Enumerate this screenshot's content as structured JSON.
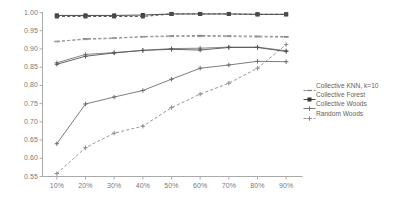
{
  "chart_data": {
    "type": "line",
    "title": "",
    "xlabel": "",
    "ylabel": "",
    "categories": [
      "10%",
      "20%",
      "30%",
      "40%",
      "50%",
      "60%",
      "70%",
      "80%",
      "90%"
    ],
    "x_tick_labels": [
      "10%",
      "20%",
      "30%",
      "40%",
      "50%",
      "60%",
      "70%",
      "80%",
      "90%"
    ],
    "y_tick_labels": [
      "1.00",
      "0.95",
      "0.90",
      "0.85",
      "0.80",
      "0.75",
      "0.70",
      "0.65",
      "0.60",
      "0.55"
    ],
    "y_ticks": [
      1.0,
      0.95,
      0.9,
      0.85,
      0.8,
      0.75,
      0.7,
      0.65,
      0.6,
      0.55
    ],
    "ylim": [
      0.55,
      1.0
    ],
    "grid": false,
    "legend_position": "right",
    "series": [
      {
        "name": "Collective KNN, k=10",
        "style": "dashed",
        "marker": "dash",
        "color": "#808080",
        "values": [
          0.92,
          0.928,
          0.93,
          0.934,
          0.936,
          0.937,
          0.936,
          0.935,
          0.934
        ]
      },
      {
        "name": "Collective Forest",
        "style": "solid",
        "marker": "square",
        "color": "#333333",
        "values": [
          0.992,
          0.992,
          0.992,
          0.993,
          0.996,
          0.996,
          0.996,
          0.995,
          0.995
        ]
      },
      {
        "name": "Collective Woods",
        "style": "solid",
        "marker": "plus",
        "color": "#6e6e6e",
        "values": [
          0.64,
          0.749,
          0.768,
          0.786,
          0.817,
          0.847,
          0.856,
          0.866,
          0.865
        ]
      },
      {
        "name": "Random Woods",
        "style": "dashed",
        "marker": "plus",
        "color": "#8a8a8a",
        "values": [
          0.558,
          0.629,
          0.669,
          0.688,
          0.739,
          0.776,
          0.806,
          0.847,
          0.912
        ]
      },
      {
        "name": "overlay-upper-dashed",
        "style": "dashed",
        "marker": "square",
        "color": "#4a4a4a",
        "values": [
          0.989,
          0.989,
          0.989,
          0.989,
          0.996,
          0.996,
          0.996,
          0.995,
          0.995
        ]
      },
      {
        "name": "overlay-mid-dashed",
        "style": "dashed",
        "marker": "dash",
        "color": "#999999",
        "values": [
          0.921,
          0.926,
          0.929,
          0.933,
          0.934,
          0.934,
          0.934,
          0.933,
          0.932
        ]
      },
      {
        "name": "overlay-solid-upper",
        "style": "solid",
        "marker": "plus",
        "color": "#7a7a7a",
        "values": [
          0.862,
          0.885,
          0.89,
          0.896,
          0.901,
          0.902,
          0.905,
          0.905,
          0.895
        ]
      },
      {
        "name": "overlay-solid-lower",
        "style": "solid",
        "marker": "plus",
        "color": "#555555",
        "values": [
          0.858,
          0.88,
          0.889,
          0.896,
          0.899,
          0.897,
          0.904,
          0.904,
          0.893
        ]
      }
    ]
  },
  "legend": {
    "entries": [
      {
        "label": "Collective KNN, k=10"
      },
      {
        "label": "Collective Forest"
      },
      {
        "label": "Collective Woods"
      },
      {
        "label": "Random Woods"
      }
    ]
  }
}
